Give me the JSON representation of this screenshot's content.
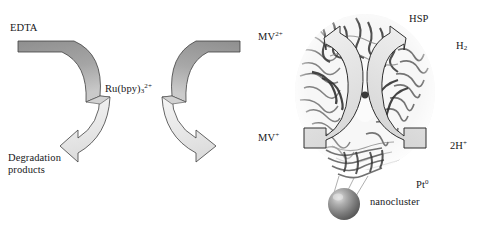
{
  "figure": {
    "kind": "reaction-scheme",
    "background": "#ffffff"
  },
  "labels": {
    "edta": "EDTA",
    "photosensitizer": "Ru(bpy)",
    "photosensitizer_sub": "3",
    "photosensitizer_sup": "2+",
    "degradation_line1": "Degradation",
    "degradation_line2": "products",
    "mv_oxidized": "MV",
    "mv_oxidized_sup": "2+",
    "mv_reduced": "MV",
    "mv_reduced_sup": "+",
    "protein": "HSP",
    "hydrogen": "H",
    "hydrogen_sub": "2",
    "protons": "2H",
    "protons_sup": "+",
    "platinum": "Pt",
    "platinum_sup": "0",
    "nanocluster": "nanocluster"
  },
  "colors": {
    "arrow_dark": "#9a9a9a",
    "arrow_light": "#ececec",
    "arrow_outline": "#3a3a3a",
    "text": "#17171a",
    "sphere_dark": "#5d5d5d",
    "sphere_light": "#d8d8d8",
    "protein_gray": "#8d8d8d",
    "background": "#ffffff"
  },
  "elements": {
    "cycle_left": {
      "name": "EDTA degradation cycle arrow",
      "shape": "c-shaped-ribbon-arrow",
      "direction": "counterclockwise-open-right",
      "head": "lower-left"
    },
    "cycle_right": {
      "name": "methyl viologen redox cycle arrow",
      "shape": "c-shaped-ribbon-arrow",
      "direction": "clockwise-open-right",
      "head": "lower-right"
    },
    "protein_arrow_left": {
      "name": "electron transfer arrow into protein",
      "head": "upper-left"
    },
    "protein_arrow_right": {
      "name": "hydrogen evolution arrow out of protein",
      "head": "upper-right"
    },
    "protein_structure": {
      "name": "HSP protein cage ribbon rendering"
    },
    "nanocluster_sphere": {
      "name": "platinum nanocluster sphere",
      "tethers": 3
    }
  }
}
